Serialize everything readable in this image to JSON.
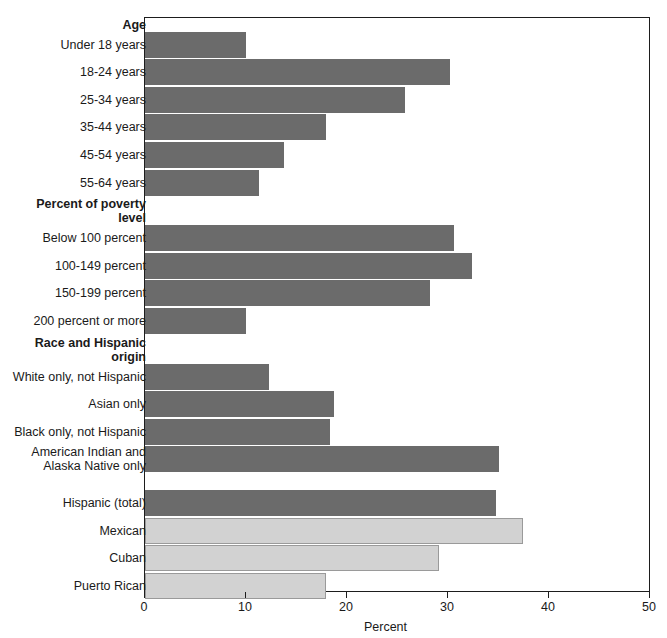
{
  "chart_data": {
    "type": "bar",
    "orientation": "horizontal",
    "title": "",
    "xlabel": "Percent",
    "ylabel": "",
    "xlim": [
      0,
      50
    ],
    "xticks": [
      "0",
      "10",
      "20",
      "30",
      "40",
      "50"
    ],
    "grid": false,
    "legend": "none",
    "colors": {
      "bar_primary": "#6b6b6b",
      "bar_secondary": "#d2d2d2",
      "bar_secondary_border": "#9a9a9a",
      "axis": "#1d1d1d",
      "text": "#1a1a1a"
    },
    "groups": [
      {
        "header": "Age",
        "categories": [
          "Under 18 years",
          "18-24 years",
          "25-34 years",
          "35-44 years",
          "45-54 years",
          "55-64 years"
        ],
        "values": [
          10.0,
          30.2,
          25.7,
          17.9,
          13.8,
          11.3
        ],
        "style": [
          "dark",
          "dark",
          "dark",
          "dark",
          "dark",
          "dark"
        ]
      },
      {
        "header": "Percent of poverty level",
        "categories": [
          "Below 100 percent",
          "100-149 percent",
          "150-199 percent",
          "200 percent or more"
        ],
        "values": [
          30.6,
          32.4,
          28.2,
          10.0
        ],
        "style": [
          "dark",
          "dark",
          "dark",
          "dark"
        ]
      },
      {
        "header": "Race and Hispanic origin",
        "categories": [
          "White only, not Hispanic",
          "Asian only",
          "Black only, not Hispanic",
          "American Indian and\nAlaska Native only",
          "Hispanic (total)",
          "Mexican",
          "Cuban",
          "Puerto Rican"
        ],
        "values": [
          12.3,
          18.7,
          18.3,
          35.0,
          34.8,
          37.4,
          29.1,
          17.9
        ],
        "style": [
          "dark",
          "dark",
          "dark",
          "dark",
          "dark",
          "light",
          "light",
          "light"
        ]
      }
    ]
  },
  "labels": {
    "group_age": "Age",
    "group_poverty_line1": "Percent of poverty",
    "group_poverty_line2": "level",
    "group_race_line1": "Race and Hispanic",
    "group_race_line2": "origin",
    "cat_under18": "Under 18 years",
    "cat_18_24": "18-24 years",
    "cat_25_34": "25-34 years",
    "cat_35_44": "35-44 years",
    "cat_45_54": "45-54 years",
    "cat_55_64": "55-64 years",
    "cat_below100": "Below 100 percent",
    "cat_100_149": "100-149 percent",
    "cat_150_199": "150-199 percent",
    "cat_200_more": "200 percent or more",
    "cat_white": "White only, not Hispanic",
    "cat_asian": "Asian only",
    "cat_black": "Black only, not Hispanic",
    "cat_aian": "American Indian and\nAlaska Native only",
    "cat_hispanic": "Hispanic (total)",
    "cat_mexican": "Mexican",
    "cat_cuban": "Cuban",
    "cat_puertorican": "Puerto Rican"
  },
  "axis": {
    "title": "Percent",
    "tick_0": "0",
    "tick_10": "10",
    "tick_20": "20",
    "tick_30": "30",
    "tick_40": "40",
    "tick_50": "50"
  }
}
